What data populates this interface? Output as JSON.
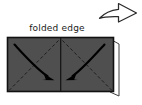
{
  "figure": {
    "background_color": "#ffffff",
    "paper": {
      "fill_color": "#4f4f4f",
      "border_color": "#111111",
      "under_layer_color": "#ffffff",
      "under_layer_border_color": "#3a3a3a",
      "x": 7,
      "y": 37,
      "width": 107,
      "height": 55
    },
    "labels": {
      "folded_edge": "folded edge"
    },
    "crease_lines": {
      "style": "dashed",
      "color": "#1f1f1f",
      "center_vertical": {
        "from_x": 60.5,
        "from_y": 37,
        "to_x": 60.5,
        "to_y": 92
      },
      "diagonals": [
        {
          "name": "left-diagonal",
          "from_x": 8,
          "from_y": 91,
          "to_x": 60.5,
          "to_y": 38
        },
        {
          "name": "right-diagonal",
          "from_x": 113,
          "from_y": 91,
          "to_x": 60.5,
          "to_y": 38
        }
      ]
    },
    "fold_arrows": [
      {
        "name": "left-fold-arrow",
        "direction": "down-right",
        "color": "#000000",
        "start_x": 15,
        "start_y": 45,
        "end_x": 52,
        "end_y": 79
      },
      {
        "name": "right-fold-arrow",
        "direction": "down-left",
        "color": "#000000",
        "start_x": 104,
        "start_y": 45,
        "end_x": 68,
        "end_y": 79
      }
    ],
    "next_step_arrow": {
      "name": "next-step-arrow",
      "shape": "hollow-outline-arrow",
      "direction": "right",
      "stroke_color": "#2b2b2b",
      "fill_color": "#ffffff",
      "x": 99,
      "y": 3,
      "width": 38,
      "height": 19
    }
  }
}
